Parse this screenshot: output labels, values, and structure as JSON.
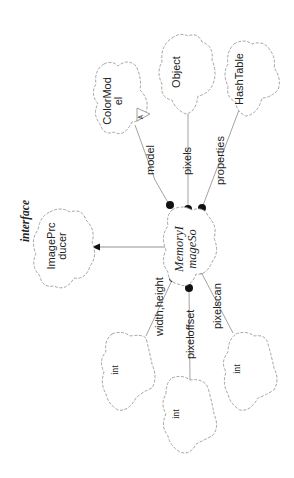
{
  "diagram": {
    "notation": "Booch class diagram (rotated 90° counter-clockwise)",
    "classes": {
      "color_model": {
        "label_line1": "ColorMod",
        "label_line2": "el",
        "adornment": "A"
      },
      "object": {
        "label": "Object"
      },
      "hash_table": {
        "label": "HashTable"
      },
      "image_producer": {
        "label_line1": "ImagePrc",
        "label_line2": "ducer",
        "stereotype": "interface"
      },
      "memory_image_source": {
        "label_line1": "MemoryI",
        "label_line2": "mageSo"
      },
      "int_width_height": {
        "label": "int"
      },
      "int_pixeloffset": {
        "label": "int"
      },
      "int_pixelscan": {
        "label": "int"
      }
    },
    "relationships": {
      "model": {
        "label": "model",
        "from": "MemoryImageSource",
        "to": "ColorModel",
        "type": "has"
      },
      "pixels": {
        "label": "pixels",
        "from": "MemoryImageSource",
        "to": "Object",
        "type": "has"
      },
      "properties": {
        "label": "properties",
        "from": "MemoryImageSource",
        "to": "HashTable",
        "type": "has"
      },
      "width_height": {
        "label": "width,height",
        "from": "MemoryImageSource",
        "to": "int",
        "type": "has"
      },
      "pixeloffset": {
        "label": "pixeloffset",
        "from": "MemoryImageSource",
        "to": "int",
        "type": "has"
      },
      "pixelscan": {
        "label": "pixelscan",
        "from": "MemoryImageSource",
        "to": "int",
        "type": "has"
      },
      "implements": {
        "label": "",
        "from": "MemoryImageSource",
        "to": "ImageProducer",
        "type": "inherits"
      }
    }
  },
  "colors": {
    "cloud_stroke": "#9a9a9a",
    "line": "#8a8a8a",
    "dot": "#111111",
    "text": "#222222",
    "background": "#ffffff"
  }
}
